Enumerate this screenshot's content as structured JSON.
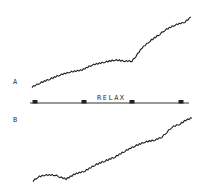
{
  "chart_data": {
    "type": "line",
    "title": "",
    "annotation": "RELAX",
    "event_markers_x_px": [
      35,
      84,
      132,
      181
    ],
    "panels": [
      {
        "label": "A",
        "series": [
          {
            "name": "trace A",
            "points": [
              [
                32,
                87
              ],
              [
                40,
                83
              ],
              [
                50,
                79
              ],
              [
                60,
                75
              ],
              [
                70,
                72
              ],
              [
                82,
                70
              ],
              [
                92,
                65
              ],
              [
                105,
                62
              ],
              [
                115,
                60
              ],
              [
                125,
                61
              ],
              [
                132,
                61
              ],
              [
                136,
                56
              ],
              [
                142,
                48
              ],
              [
                150,
                41
              ],
              [
                160,
                34
              ],
              [
                165,
                30
              ],
              [
                175,
                25
              ],
              [
                185,
                22
              ],
              [
                191,
                17
              ]
            ]
          }
        ]
      },
      {
        "label": "B",
        "series": [
          {
            "name": "trace B",
            "points": [
              [
                33,
                181
              ],
              [
                38,
                177
              ],
              [
                45,
                175
              ],
              [
                55,
                175
              ],
              [
                60,
                177
              ],
              [
                66,
                179
              ],
              [
                75,
                174
              ],
              [
                85,
                171
              ],
              [
                95,
                165
              ],
              [
                105,
                161
              ],
              [
                115,
                157
              ],
              [
                125,
                151
              ],
              [
                135,
                146
              ],
              [
                145,
                142
              ],
              [
                155,
                140
              ],
              [
                162,
                137
              ],
              [
                167,
                132
              ],
              [
                172,
                127
              ],
              [
                180,
                124
              ],
              [
                186,
                120
              ],
              [
                192,
                118
              ]
            ]
          }
        ]
      }
    ],
    "grid": false,
    "legend": null
  },
  "labels": {
    "a": "A",
    "b": "B",
    "relax": "RELAX"
  }
}
